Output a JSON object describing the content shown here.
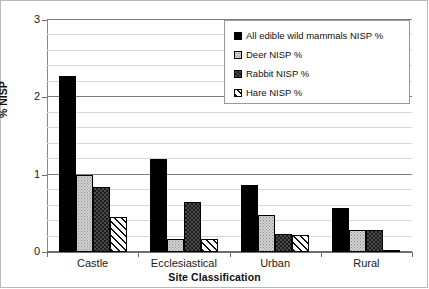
{
  "chart_data": {
    "type": "bar",
    "title": "",
    "xlabel": "Site Classification",
    "ylabel": "% NISP",
    "categories": [
      "Castle",
      "Ecclesiastical",
      "Urban",
      "Rural"
    ],
    "series": [
      {
        "name": "All edible wild mammals NISP %",
        "pattern": "solid-black",
        "values": [
          2.27,
          1.2,
          0.87,
          0.57
        ]
      },
      {
        "name": "Deer NISP %",
        "pattern": "light-stipple",
        "values": [
          1.0,
          0.17,
          0.48,
          0.28
        ]
      },
      {
        "name": "Rabbit NISP %",
        "pattern": "dark-checker",
        "values": [
          0.84,
          0.65,
          0.23,
          0.28
        ]
      },
      {
        "name": "Hare NISP %",
        "pattern": "diagonal-hatch",
        "values": [
          0.45,
          0.17,
          0.22,
          0.02
        ]
      }
    ],
    "ylim": [
      0,
      3
    ],
    "ytick_labels": [
      "0",
      "1",
      "2",
      "3"
    ],
    "ytick_values": [
      0,
      1,
      2,
      3
    ],
    "yminor_step": 0.2,
    "grid": true,
    "legend_position": "top-right"
  },
  "legend": {
    "items": [
      {
        "label": "All edible wild mammals NISP %"
      },
      {
        "label": "Deer NISP %"
      },
      {
        "label": "Rabbit NISP %"
      },
      {
        "label": "Hare NISP %"
      }
    ]
  }
}
